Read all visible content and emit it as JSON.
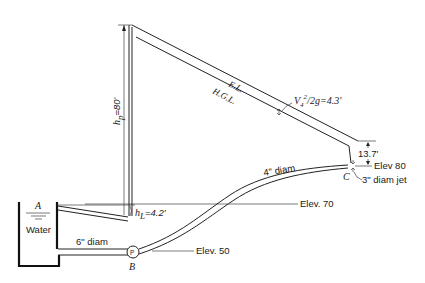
{
  "diagram": {
    "type": "hydraulic pumping system with energy line and hydraulic grade line",
    "labels": {
      "energy_line": "E.L.",
      "hgl": "H.G.L.",
      "velocity_head": "V₄²/2g=4.3'",
      "velocity_head_v": "V",
      "velocity_head_sub": "4",
      "velocity_head_sup": "2",
      "velocity_head_rest": "/2g=4.3'",
      "pump_head": "h",
      "pump_head_sub": "p",
      "pump_head_value": "=80'",
      "head_loss": "h",
      "head_loss_sub": "L",
      "head_loss_value": "=4.2'",
      "drop_c": "13.7'",
      "elev_80": "Elev 80",
      "elev_70": "Elev. 70",
      "elev_50": "Elev. 50",
      "jet": "3\" diam jet",
      "pipe_4in": "4\" diam",
      "pipe_6in": "6\" diam",
      "water": "Water",
      "point_a": "A",
      "point_b": "B",
      "point_c": "C",
      "pump_symbol": "P"
    },
    "colors": {
      "line": "#222222",
      "background": "#ffffff"
    }
  }
}
